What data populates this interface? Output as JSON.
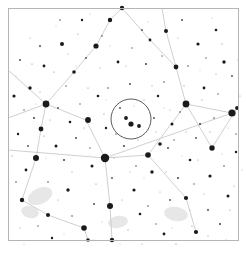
{
  "chart_data": {
    "type": "scatter",
    "title": "",
    "subtitle": "",
    "xlabel": "",
    "ylabel": "",
    "grid": false,
    "legend_position": "none",
    "projection": "sky-chart-inverted",
    "xlim": [
      0,
      246
    ],
    "ylim": [
      0,
      254
    ],
    "background_color": "#ffffff",
    "star_color": "#1a1a1a",
    "line_color": "#c9c9c9",
    "frame_color": "#b5b5b5",
    "nebula_color": "#dfdfdf",
    "fov_circle_color": "#4a4a4a",
    "frame": {
      "x": 8,
      "y": 8,
      "width": 230,
      "height": 232
    },
    "fov_circle": {
      "cx": 131,
      "cy": 119,
      "r": 20,
      "label": ""
    },
    "constellation_lines": [
      [
        [
          8,
          70
        ],
        [
          46,
          104
        ]
      ],
      [
        [
          46,
          104
        ],
        [
          41,
          129
        ]
      ],
      [
        [
          41,
          129
        ],
        [
          36,
          158
        ]
      ],
      [
        [
          46,
          104
        ],
        [
          74,
          72
        ]
      ],
      [
        [
          74,
          72
        ],
        [
          96,
          46
        ]
      ],
      [
        [
          96,
          46
        ],
        [
          110,
          20
        ]
      ],
      [
        [
          110,
          20
        ],
        [
          122,
          8
        ]
      ],
      [
        [
          46,
          104
        ],
        [
          86,
          120
        ]
      ],
      [
        [
          86,
          120
        ],
        [
          105,
          158
        ]
      ],
      [
        [
          105,
          158
        ],
        [
          148,
          155
        ]
      ],
      [
        [
          148,
          155
        ],
        [
          186,
          104
        ]
      ],
      [
        [
          186,
          104
        ],
        [
          232,
          113
        ]
      ],
      [
        [
          8,
          150
        ],
        [
          105,
          158
        ]
      ],
      [
        [
          105,
          158
        ],
        [
          232,
          113
        ]
      ],
      [
        [
          186,
          104
        ],
        [
          176,
          67
        ]
      ],
      [
        [
          176,
          67
        ],
        [
          166,
          31
        ]
      ],
      [
        [
          166,
          31
        ],
        [
          162,
          8
        ]
      ],
      [
        [
          186,
          104
        ],
        [
          212,
          148
        ]
      ],
      [
        [
          212,
          148
        ],
        [
          237,
          108
        ]
      ],
      [
        [
          105,
          158
        ],
        [
          110,
          206
        ]
      ],
      [
        [
          110,
          206
        ],
        [
          112,
          240
        ]
      ],
      [
        [
          36,
          158
        ],
        [
          22,
          200
        ]
      ],
      [
        [
          22,
          200
        ],
        [
          48,
          215
        ]
      ],
      [
        [
          48,
          215
        ],
        [
          84,
          228
        ]
      ],
      [
        [
          84,
          228
        ],
        [
          88,
          240
        ]
      ],
      [
        [
          148,
          155
        ],
        [
          186,
          198
        ]
      ],
      [
        [
          186,
          198
        ],
        [
          196,
          232
        ]
      ],
      [
        [
          8,
          118
        ],
        [
          46,
          104
        ]
      ],
      [
        [
          122,
          8
        ],
        [
          150,
          40
        ]
      ],
      [
        [
          150,
          40
        ],
        [
          176,
          67
        ]
      ]
    ],
    "nebulae": [
      {
        "cx": 40,
        "cy": 196,
        "rx": 13,
        "ry": 8,
        "angle": -25
      },
      {
        "cx": 30,
        "cy": 212,
        "rx": 9,
        "ry": 6,
        "angle": 15
      },
      {
        "cx": 176,
        "cy": 214,
        "rx": 12,
        "ry": 7,
        "angle": 10
      },
      {
        "cx": 118,
        "cy": 222,
        "rx": 10,
        "ry": 6,
        "angle": -10
      }
    ],
    "stars": [
      {
        "x": 105,
        "y": 158,
        "r": 4.2
      },
      {
        "x": 232,
        "y": 113,
        "r": 3.6
      },
      {
        "x": 46,
        "y": 104,
        "r": 3.4
      },
      {
        "x": 186,
        "y": 104,
        "r": 3.4
      },
      {
        "x": 36,
        "y": 158,
        "r": 3.0
      },
      {
        "x": 110,
        "y": 206,
        "r": 3.0
      },
      {
        "x": 88,
        "y": 120,
        "r": 2.9
      },
      {
        "x": 148,
        "y": 155,
        "r": 2.8
      },
      {
        "x": 84,
        "y": 228,
        "r": 2.8
      },
      {
        "x": 212,
        "y": 148,
        "r": 2.7
      },
      {
        "x": 131,
        "y": 124,
        "r": 2.6
      },
      {
        "x": 96,
        "y": 46,
        "r": 2.6
      },
      {
        "x": 41,
        "y": 129,
        "r": 2.4
      },
      {
        "x": 176,
        "y": 67,
        "r": 2.4
      },
      {
        "x": 122,
        "y": 8,
        "r": 2.2
      },
      {
        "x": 110,
        "y": 20,
        "r": 2.2
      },
      {
        "x": 22,
        "y": 200,
        "r": 2.2
      },
      {
        "x": 112,
        "y": 240,
        "r": 2.2
      },
      {
        "x": 196,
        "y": 232,
        "r": 2.1
      },
      {
        "x": 186,
        "y": 198,
        "r": 2.1
      },
      {
        "x": 62,
        "y": 44,
        "r": 2.0
      },
      {
        "x": 166,
        "y": 31,
        "r": 2.0
      },
      {
        "x": 48,
        "y": 215,
        "r": 2.0
      },
      {
        "x": 126,
        "y": 118,
        "r": 1.9
      },
      {
        "x": 139,
        "y": 126,
        "r": 1.9
      },
      {
        "x": 237,
        "y": 108,
        "r": 1.9
      },
      {
        "x": 74,
        "y": 72,
        "r": 1.8
      },
      {
        "x": 160,
        "y": 144,
        "r": 1.8
      },
      {
        "x": 88,
        "y": 240,
        "r": 1.8
      },
      {
        "x": 30,
        "y": 88,
        "r": 1.7
      },
      {
        "x": 224,
        "y": 62,
        "r": 1.7
      },
      {
        "x": 152,
        "y": 172,
        "r": 1.7
      },
      {
        "x": 68,
        "y": 190,
        "r": 1.7
      },
      {
        "x": 210,
        "y": 176,
        "r": 1.6
      },
      {
        "x": 14,
        "y": 96,
        "r": 1.6
      },
      {
        "x": 198,
        "y": 44,
        "r": 1.6
      },
      {
        "x": 134,
        "y": 190,
        "r": 1.6
      },
      {
        "x": 92,
        "y": 166,
        "r": 1.5
      },
      {
        "x": 172,
        "y": 124,
        "r": 1.5
      },
      {
        "x": 56,
        "y": 146,
        "r": 1.5
      },
      {
        "x": 228,
        "y": 196,
        "r": 1.5
      },
      {
        "x": 118,
        "y": 62,
        "r": 1.4
      },
      {
        "x": 44,
        "y": 66,
        "r": 1.4
      },
      {
        "x": 204,
        "y": 88,
        "r": 1.4
      },
      {
        "x": 150,
        "y": 40,
        "r": 1.4
      },
      {
        "x": 26,
        "y": 170,
        "r": 1.4
      },
      {
        "x": 164,
        "y": 234,
        "r": 1.4
      },
      {
        "x": 98,
        "y": 96,
        "r": 1.3
      },
      {
        "x": 216,
        "y": 30,
        "r": 1.3
      },
      {
        "x": 140,
        "y": 214,
        "r": 1.3
      },
      {
        "x": 70,
        "y": 122,
        "r": 1.3
      },
      {
        "x": 190,
        "y": 160,
        "r": 1.3
      },
      {
        "x": 18,
        "y": 134,
        "r": 1.2
      },
      {
        "x": 106,
        "y": 128,
        "r": 1.2
      },
      {
        "x": 236,
        "y": 152,
        "r": 1.2
      },
      {
        "x": 82,
        "y": 20,
        "r": 1.2
      },
      {
        "x": 158,
        "y": 96,
        "r": 1.2
      },
      {
        "x": 52,
        "y": 238,
        "r": 1.2
      },
      {
        "x": 200,
        "y": 124,
        "r": 1.1
      },
      {
        "x": 124,
        "y": 146,
        "r": 1.1
      },
      {
        "x": 34,
        "y": 118,
        "r": 1.1
      },
      {
        "x": 178,
        "y": 178,
        "r": 1.1
      },
      {
        "x": 146,
        "y": 64,
        "r": 1.1
      },
      {
        "x": 64,
        "y": 160,
        "r": 1.1
      },
      {
        "x": 220,
        "y": 224,
        "r": 1.1
      },
      {
        "x": 94,
        "y": 204,
        "r": 1.0
      },
      {
        "x": 168,
        "y": 148,
        "r": 1.0
      },
      {
        "x": 40,
        "y": 46,
        "r": 1.0
      },
      {
        "x": 208,
        "y": 210,
        "r": 1.0
      },
      {
        "x": 130,
        "y": 84,
        "r": 1.0
      },
      {
        "x": 76,
        "y": 138,
        "r": 1.0
      },
      {
        "x": 182,
        "y": 20,
        "r": 1.0
      },
      {
        "x": 20,
        "y": 60,
        "r": 1.0
      },
      {
        "x": 154,
        "y": 118,
        "r": 0.9
      },
      {
        "x": 112,
        "y": 178,
        "r": 0.9
      },
      {
        "x": 232,
        "y": 76,
        "r": 0.9
      },
      {
        "x": 58,
        "y": 108,
        "r": 0.9
      },
      {
        "x": 196,
        "y": 138,
        "r": 0.9
      },
      {
        "x": 142,
        "y": 30,
        "r": 0.9
      },
      {
        "x": 28,
        "y": 146,
        "r": 0.9
      },
      {
        "x": 170,
        "y": 200,
        "r": 0.9
      },
      {
        "x": 86,
        "y": 58,
        "r": 0.9
      },
      {
        "x": 120,
        "y": 108,
        "r": 0.9
      },
      {
        "x": 214,
        "y": 118,
        "r": 0.8
      },
      {
        "x": 48,
        "y": 182,
        "r": 0.8
      },
      {
        "x": 164,
        "y": 82,
        "r": 0.8
      },
      {
        "x": 102,
        "y": 36,
        "r": 0.8
      },
      {
        "x": 188,
        "y": 66,
        "r": 0.8
      },
      {
        "x": 136,
        "y": 166,
        "r": 0.8
      },
      {
        "x": 72,
        "y": 216,
        "r": 0.8
      },
      {
        "x": 224,
        "y": 166,
        "r": 0.8
      },
      {
        "x": 16,
        "y": 182,
        "r": 0.8
      },
      {
        "x": 108,
        "y": 88,
        "r": 0.8
      },
      {
        "x": 180,
        "y": 112,
        "r": 0.8
      },
      {
        "x": 60,
        "y": 20,
        "r": 0.8
      },
      {
        "x": 148,
        "y": 206,
        "r": 0.8
      },
      {
        "x": 206,
        "y": 58,
        "r": 0.7
      },
      {
        "x": 90,
        "y": 148,
        "r": 0.7
      },
      {
        "x": 132,
        "y": 48,
        "r": 0.7
      },
      {
        "x": 38,
        "y": 226,
        "r": 0.7
      },
      {
        "x": 174,
        "y": 140,
        "r": 0.7
      },
      {
        "x": 218,
        "y": 94,
        "r": 0.7
      },
      {
        "x": 66,
        "y": 86,
        "r": 0.7
      },
      {
        "x": 156,
        "y": 224,
        "r": 0.7
      },
      {
        "x": 24,
        "y": 110,
        "r": 0.7
      },
      {
        "x": 194,
        "y": 184,
        "r": 0.7
      },
      {
        "x": 116,
        "y": 134,
        "r": 0.7
      },
      {
        "x": 80,
        "y": 104,
        "r": 0.7
      },
      {
        "x": 162,
        "y": 56,
        "r": 0.7
      },
      {
        "x": 236,
        "y": 134,
        "r": 0.7
      },
      {
        "x": 44,
        "y": 136,
        "r": 0.6
      },
      {
        "x": 128,
        "y": 230,
        "r": 0.6
      },
      {
        "x": 202,
        "y": 100,
        "r": 0.6
      },
      {
        "x": 96,
        "y": 184,
        "r": 0.6
      },
      {
        "x": 184,
        "y": 86,
        "r": 0.6
      },
      {
        "x": 54,
        "y": 72,
        "r": 0.6
      },
      {
        "x": 144,
        "y": 100,
        "r": 0.6
      },
      {
        "x": 230,
        "y": 210,
        "r": 0.6
      },
      {
        "x": 12,
        "y": 156,
        "r": 0.6
      },
      {
        "x": 104,
        "y": 114,
        "r": 0.6
      },
      {
        "x": 192,
        "y": 226,
        "r": 0.6
      },
      {
        "x": 78,
        "y": 34,
        "r": 0.6
      },
      {
        "x": 166,
        "y": 172,
        "r": 0.6
      },
      {
        "x": 222,
        "y": 44,
        "r": 0.6
      },
      {
        "x": 32,
        "y": 64,
        "r": 0.6
      },
      {
        "x": 138,
        "y": 140,
        "r": 0.6
      },
      {
        "x": 210,
        "y": 132,
        "r": 0.6
      },
      {
        "x": 88,
        "y": 88,
        "r": 0.6
      },
      {
        "x": 176,
        "y": 244,
        "r": 0.6
      },
      {
        "x": 50,
        "y": 120,
        "r": 0.5
      },
      {
        "x": 122,
        "y": 200,
        "r": 0.5
      },
      {
        "x": 198,
        "y": 160,
        "r": 0.5
      },
      {
        "x": 100,
        "y": 68,
        "r": 0.5
      },
      {
        "x": 160,
        "y": 192,
        "r": 0.5
      },
      {
        "x": 234,
        "y": 186,
        "r": 0.5
      },
      {
        "x": 20,
        "y": 228,
        "r": 0.5
      },
      {
        "x": 114,
        "y": 158,
        "r": 0.5
      },
      {
        "x": 186,
        "y": 132,
        "r": 0.5
      },
      {
        "x": 68,
        "y": 54,
        "r": 0.5
      },
      {
        "x": 152,
        "y": 86,
        "r": 0.5
      },
      {
        "x": 226,
        "y": 240,
        "r": 0.5
      },
      {
        "x": 40,
        "y": 92,
        "r": 0.5
      },
      {
        "x": 130,
        "y": 172,
        "r": 0.5
      },
      {
        "x": 204,
        "y": 194,
        "r": 0.5
      },
      {
        "x": 84,
        "y": 128,
        "r": 0.5
      },
      {
        "x": 170,
        "y": 110,
        "r": 0.5
      },
      {
        "x": 240,
        "y": 96,
        "r": 0.5
      },
      {
        "x": 58,
        "y": 200,
        "r": 0.5
      },
      {
        "x": 142,
        "y": 244,
        "r": 0.5
      },
      {
        "x": 216,
        "y": 74,
        "r": 0.5
      },
      {
        "x": 94,
        "y": 240,
        "r": 0.5
      },
      {
        "x": 178,
        "y": 38,
        "r": 0.5
      },
      {
        "x": 30,
        "y": 38,
        "r": 0.5
      },
      {
        "x": 126,
        "y": 66,
        "r": 0.5
      },
      {
        "x": 208,
        "y": 236,
        "r": 0.5
      },
      {
        "x": 72,
        "y": 172,
        "r": 0.5
      },
      {
        "x": 156,
        "y": 132,
        "r": 0.5
      },
      {
        "x": 238,
        "y": 60,
        "r": 0.5
      },
      {
        "x": 46,
        "y": 158,
        "r": 0.4
      },
      {
        "x": 110,
        "y": 46,
        "r": 0.4
      },
      {
        "x": 190,
        "y": 210,
        "r": 0.4
      },
      {
        "x": 64,
        "y": 234,
        "r": 0.4
      },
      {
        "x": 148,
        "y": 22,
        "r": 0.4
      },
      {
        "x": 228,
        "y": 128,
        "r": 0.4
      },
      {
        "x": 16,
        "y": 76,
        "r": 0.4
      },
      {
        "x": 102,
        "y": 222,
        "r": 0.4
      },
      {
        "x": 182,
        "y": 156,
        "r": 0.4
      },
      {
        "x": 76,
        "y": 66,
        "r": 0.4
      },
      {
        "x": 164,
        "y": 108,
        "r": 0.4
      },
      {
        "x": 242,
        "y": 170,
        "r": 0.4
      },
      {
        "x": 36,
        "y": 104,
        "r": 0.4
      },
      {
        "x": 120,
        "y": 244,
        "r": 0.4
      },
      {
        "x": 200,
        "y": 70,
        "r": 0.4
      },
      {
        "x": 90,
        "y": 14,
        "r": 0.4
      },
      {
        "x": 172,
        "y": 228,
        "r": 0.4
      },
      {
        "x": 24,
        "y": 244,
        "r": 0.4
      },
      {
        "x": 134,
        "y": 106,
        "r": 0.4
      },
      {
        "x": 212,
        "y": 18,
        "r": 0.4
      },
      {
        "x": 56,
        "y": 26,
        "r": 0.4
      },
      {
        "x": 144,
        "y": 178,
        "r": 0.4
      },
      {
        "x": 222,
        "y": 154,
        "r": 0.4
      },
      {
        "x": 106,
        "y": 100,
        "r": 0.4
      }
    ]
  }
}
